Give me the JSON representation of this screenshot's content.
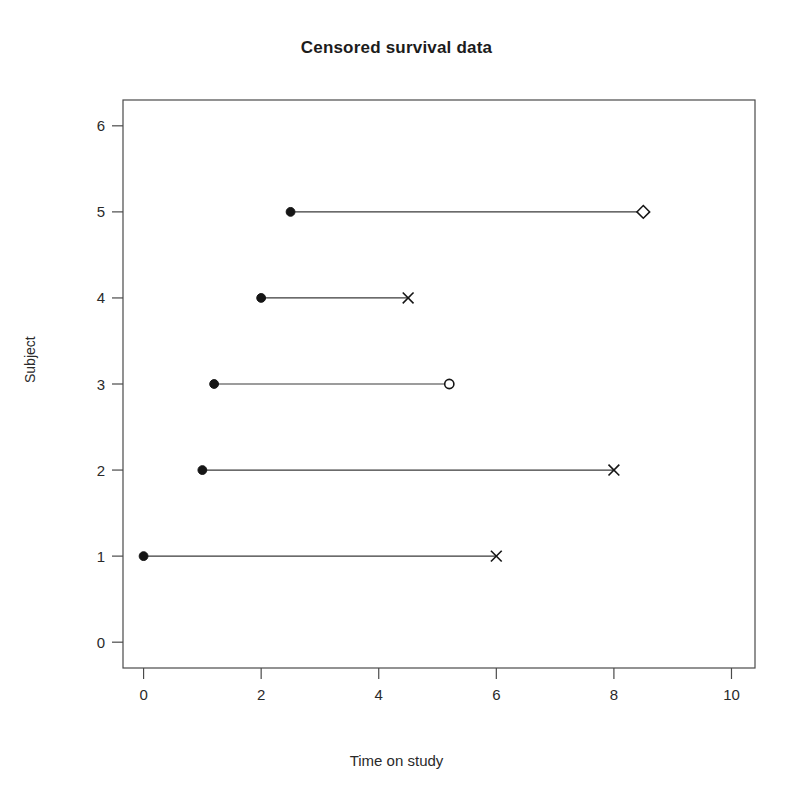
{
  "chart_data": {
    "type": "scatter",
    "title": "Censored survival data",
    "xlabel": "Time on study",
    "ylabel": "Subject",
    "xlim": [
      -0.35,
      10.4
    ],
    "ylim": [
      -0.3,
      6.3
    ],
    "xticks": [
      0,
      2,
      4,
      6,
      8,
      10
    ],
    "xtick_labels": [
      "0",
      "2",
      "4",
      "6",
      "8",
      "10"
    ],
    "yticks": [
      0,
      1,
      2,
      3,
      4,
      5,
      6
    ],
    "ytick_labels": [
      "0",
      "1",
      "2",
      "3",
      "4",
      "5",
      "6"
    ],
    "grid": false,
    "legend": "none",
    "series": [
      {
        "name": "Subject 1",
        "subject": 1,
        "start": 0.0,
        "end": 6.0,
        "start_marker": "filled-circle",
        "end_marker": "cross",
        "event": "death"
      },
      {
        "name": "Subject 2",
        "subject": 2,
        "start": 1.0,
        "end": 8.0,
        "start_marker": "filled-circle",
        "end_marker": "cross",
        "event": "death"
      },
      {
        "name": "Subject 3",
        "subject": 3,
        "start": 1.2,
        "end": 5.2,
        "start_marker": "filled-circle",
        "end_marker": "open-circle",
        "event": "censored"
      },
      {
        "name": "Subject 4",
        "subject": 4,
        "start": 2.0,
        "end": 4.5,
        "start_marker": "filled-circle",
        "end_marker": "cross",
        "event": "death"
      },
      {
        "name": "Subject 5",
        "subject": 5,
        "start": 2.5,
        "end": 8.5,
        "start_marker": "filled-circle",
        "end_marker": "open-diamond",
        "event": "censored"
      }
    ],
    "marker_legend": {
      "filled-circle": "entry into study",
      "cross": "death / event",
      "open-circle": "censored",
      "open-diamond": "censored"
    },
    "colors": {
      "line": "#3a3a3a",
      "marker": "#151515",
      "frame": "#4a4a4a",
      "background": "#ffffff"
    }
  },
  "figure": {
    "title": "Censored survival data",
    "xlabel": "Time on study",
    "ylabel": "Subject"
  }
}
